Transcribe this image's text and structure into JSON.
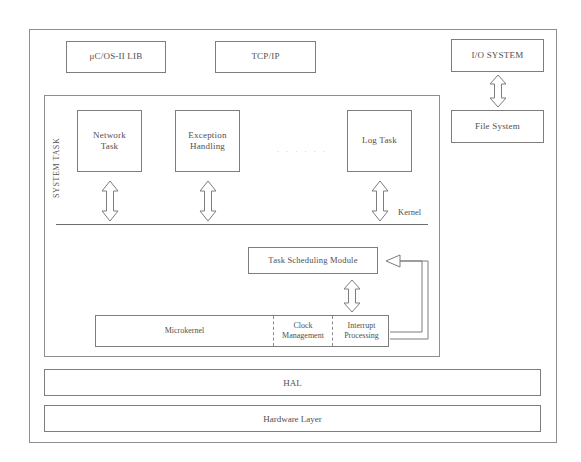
{
  "diagram": {
    "top_modules": [
      {
        "label": "μC/OS-II LIB",
        "name": "ucos-ii-lib-box"
      },
      {
        "label": "TCP/IP",
        "name": "tcpip-box"
      }
    ],
    "right_column": {
      "io_system": "I/O SYSTEM",
      "file_system": "File System",
      "connector": "double-headed-arrow"
    },
    "system_task": {
      "group_label": "SYSTEM TASK",
      "tasks": [
        {
          "line1": "Network",
          "line2": "Task"
        },
        {
          "line1": "Exception",
          "line2": "Handling"
        },
        {
          "line1": "Log Task",
          "line2": ""
        }
      ],
      "ellipsis": "· · · · · ·"
    },
    "kernel": {
      "label": "Kernel",
      "scheduler": "Task Scheduling Module",
      "microkernel_strip": [
        {
          "label": "Microkernel",
          "line1": "Microkernel",
          "line2": ""
        },
        {
          "label": "Clock Management",
          "line1": "Clock",
          "line2": "Management"
        },
        {
          "label": "Interrupt Processing",
          "line1": "Interrupt",
          "line2": "Processing"
        }
      ]
    },
    "lower_layers": [
      {
        "label": "HAL"
      },
      {
        "label": "Hardware Layer"
      }
    ],
    "colors": {
      "line": "#7d7d7d",
      "frame": "#8e8e8e",
      "text": "#4f4f4f",
      "background": "#ffffff",
      "dots": "#c9c9c9"
    }
  }
}
